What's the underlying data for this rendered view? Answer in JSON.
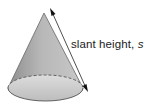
{
  "diagram": {
    "shape": "cone",
    "label_text": "slant height, ",
    "label_var": "s",
    "colors": {
      "fill_light": "#d4d4d4",
      "fill_dark": "#9a9a9a",
      "outline": "#555555",
      "arrow": "#222222"
    }
  }
}
